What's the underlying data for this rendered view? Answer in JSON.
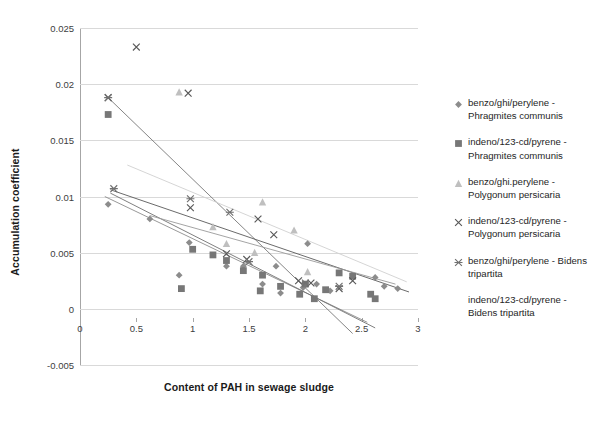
{
  "chart_data": {
    "type": "scatter",
    "title": "",
    "xlabel": "Content of PAH in sewage sludge",
    "ylabel": "Accumulation coefficient",
    "xlim": [
      0,
      3
    ],
    "ylim": [
      -0.005,
      0.025
    ],
    "xticks": [
      "0",
      "0.5",
      "1",
      "1.5",
      "2",
      "2.5",
      "3"
    ],
    "xtick_values": [
      0,
      0.5,
      1,
      1.5,
      2,
      2.5,
      3
    ],
    "yticks": [
      "0.025",
      "0.02",
      "0.015",
      "0.01",
      "0.005",
      "0",
      "-0.005"
    ],
    "ytick_values": [
      0.025,
      0.02,
      0.015,
      0.01,
      0.005,
      0,
      -0.005
    ],
    "grid": "horizontal",
    "legend_position": "right",
    "series": [
      {
        "name": "benzo/ghi/perylene - Phragmites communis",
        "marker": "diamond",
        "color": "#8c8c8c",
        "points": [
          [
            0.25,
            0.0093
          ],
          [
            0.62,
            0.008
          ],
          [
            0.88,
            0.003
          ],
          [
            0.97,
            0.0059
          ],
          [
            1.3,
            0.0038
          ],
          [
            1.45,
            0.0038
          ],
          [
            1.62,
            0.0022
          ],
          [
            1.74,
            0.0038
          ],
          [
            1.78,
            0.0014
          ],
          [
            1.98,
            0.0019
          ],
          [
            2.02,
            0.0058
          ],
          [
            2.1,
            0.0022
          ],
          [
            2.22,
            0.0016
          ],
          [
            2.62,
            0.0028
          ],
          [
            2.7,
            0.002
          ],
          [
            2.82,
            0.0018
          ]
        ],
        "trendline": [
          [
            0.22,
            0.01
          ],
          [
            2.55,
            -0.0012
          ]
        ]
      },
      {
        "name": "indeno/123-cd/pyrene - Phragmites communis",
        "marker": "square",
        "color": "#777777",
        "points": [
          [
            0.25,
            0.0173
          ],
          [
            0.9,
            0.0018
          ],
          [
            1.0,
            0.0053
          ],
          [
            1.18,
            0.0048
          ],
          [
            1.3,
            0.0043
          ],
          [
            1.45,
            0.0034
          ],
          [
            1.6,
            0.0016
          ],
          [
            1.62,
            0.003
          ],
          [
            1.78,
            0.002
          ],
          [
            1.95,
            0.0013
          ],
          [
            2.0,
            0.0022
          ],
          [
            2.08,
            0.0009
          ],
          [
            2.18,
            0.0017
          ],
          [
            2.3,
            0.0032
          ],
          [
            2.42,
            0.0029
          ],
          [
            2.58,
            0.0013
          ],
          [
            2.62,
            0.0009
          ]
        ],
        "trendline": [
          [
            0.25,
            0.0188
          ],
          [
            2.42,
            -0.0022
          ]
        ]
      },
      {
        "name": "benzo/ghi.perylene - Polygonum persicaria",
        "marker": "triangle",
        "color": "#bfbfbf",
        "points": [
          [
            0.88,
            0.0193
          ],
          [
            1.18,
            0.0073
          ],
          [
            1.3,
            0.0058
          ],
          [
            1.55,
            0.005
          ],
          [
            1.62,
            0.0095
          ],
          [
            1.9,
            0.007
          ],
          [
            2.02,
            0.0033
          ]
        ],
        "trendline": [
          [
            0.42,
            0.0128
          ],
          [
            2.9,
            0.0024
          ]
        ]
      },
      {
        "name": "indeno/123-cd/pyrene - Polygonum persicaria",
        "marker": "cross",
        "color": "#595959",
        "points": [
          [
            0.5,
            0.0233
          ],
          [
            0.25,
            0.0188
          ],
          [
            0.96,
            0.0192
          ],
          [
            0.98,
            0.009
          ],
          [
            1.3,
            0.0049
          ],
          [
            1.58,
            0.008
          ],
          [
            1.72,
            0.0066
          ],
          [
            1.48,
            0.0044
          ],
          [
            1.94,
            0.0025
          ],
          [
            2.05,
            0.0023
          ],
          [
            2.3,
            0.0018
          ],
          [
            2.42,
            0.0025
          ]
        ],
        "trendline": [
          [
            0.27,
            0.0106
          ],
          [
            2.92,
            0.0015
          ]
        ]
      },
      {
        "name": "benzo/ghi/perylene - Bidens tripartita",
        "marker": "asterisk-cross",
        "color": "#707070",
        "points": [
          [
            0.25,
            0.0188
          ],
          [
            0.3,
            0.0107
          ],
          [
            0.98,
            0.0098
          ],
          [
            1.33,
            0.0086
          ],
          [
            1.5,
            0.0042
          ],
          [
            2.0,
            0.0023
          ],
          [
            2.3,
            0.002
          ]
        ],
        "trendline": [
          [
            0.27,
            0.0103
          ],
          [
            2.62,
            -0.0017
          ]
        ]
      },
      {
        "name": "indeno/123-cd/pyrene - Bidens tripartita",
        "marker": "none",
        "color": "#808080",
        "points": [],
        "trendline": [
          [
            0.62,
            0.0083
          ],
          [
            2.8,
            0.0022
          ]
        ]
      }
    ]
  },
  "axes": {
    "y_title": "Accumulation coefficient",
    "x_title": "Content of PAH in sewage sludge",
    "y_labels": [
      "0.025",
      "0.02",
      "0.015",
      "0.01",
      "0.005",
      "0",
      "-0.005"
    ],
    "x_labels": [
      "0",
      "0.5",
      "1",
      "1.5",
      "2",
      "2.5",
      "3"
    ]
  },
  "legend": {
    "items": [
      {
        "marker": "diamond-icon",
        "label": "benzo/ghi/perylene -\nPhragmites communis"
      },
      {
        "marker": "square-icon",
        "label": "indeno/123-cd/pyrene -\nPhragmites communis"
      },
      {
        "marker": "triangle-icon",
        "label": "benzo/ghi.perylene -\nPolygonum persicaria"
      },
      {
        "marker": "cross-icon",
        "label": "indeno/123-cd/pyrene -\nPolygonum persicaria"
      },
      {
        "marker": "asterisk-cross-icon",
        "label": "benzo/ghi/perylene - Bidens\ntripartita"
      },
      {
        "marker": "none-icon",
        "label": "indeno/123-cd/pyrene -\nBidens tripartita"
      }
    ]
  }
}
